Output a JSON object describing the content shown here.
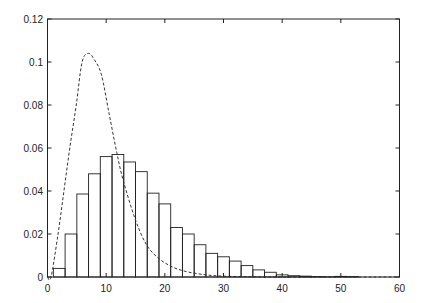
{
  "chart_data": {
    "type": "bar",
    "title": "",
    "xlabel": "",
    "ylabel": "",
    "xlim": [
      0,
      60
    ],
    "ylim": [
      0,
      0.12
    ],
    "grid": false,
    "legend": null,
    "x_ticks": [
      "0",
      "10",
      "20",
      "30",
      "40",
      "50",
      "60"
    ],
    "y_ticks": [
      "0",
      "0.02",
      "0.04",
      "0.06",
      "0.08",
      "0.1",
      "0.12"
    ],
    "histogram": {
      "name": "histogram",
      "style": "unfilled bars, black outline",
      "bin_edges": [
        1,
        3,
        5,
        7,
        9,
        11,
        13,
        15,
        17,
        19,
        21,
        23,
        25,
        27,
        29,
        31,
        33,
        35,
        37,
        39,
        41,
        43,
        45,
        47,
        49,
        51,
        53
      ],
      "values": [
        0.004,
        0.02,
        0.0386,
        0.048,
        0.056,
        0.057,
        0.0535,
        0.049,
        0.039,
        0.034,
        0.023,
        0.02,
        0.015,
        0.011,
        0.0094,
        0.0074,
        0.0053,
        0.0033,
        0.0022,
        0.001,
        0.0006,
        0.0004,
        0.0002,
        0.0001,
        0.0003,
        0.0002
      ]
    },
    "curve": {
      "name": "density curve",
      "style": "dashed",
      "x": [
        0,
        0.6,
        1.8,
        2.8,
        3.8,
        4.9,
        5.9,
        7.0,
        8.0,
        9.2,
        10.5,
        11.8,
        12.9,
        15.0,
        16.9,
        18.9,
        21.2,
        23.7,
        27,
        30,
        35,
        40,
        60
      ],
      "y": [
        0,
        0.0,
        0.02,
        0.04,
        0.06,
        0.08,
        0.1,
        0.104,
        0.101,
        0.094,
        0.076,
        0.058,
        0.045,
        0.0265,
        0.0149,
        0.0088,
        0.0048,
        0.0025,
        0.001,
        0.0004,
        0.0001,
        0.0,
        0.0
      ]
    }
  }
}
